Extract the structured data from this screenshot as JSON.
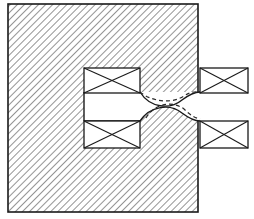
{
  "figure": {
    "title": "Hatched body cross-section with four crossed-rectangle coil symbols",
    "type": "engineering-cross-section",
    "canvas": {
      "width": 254,
      "height": 219
    },
    "colors": {
      "background": "#ffffff",
      "outline": "#1a1a1a",
      "hatch": "#3a3a3a",
      "dashed": "#2b2b2b"
    },
    "hatching": {
      "angle_degrees": 45,
      "direction": "top-left-to-bottom-right",
      "spacing_px": 5,
      "line_width_px": 1.1,
      "color": "#3a3a3a"
    },
    "body": {
      "label": "hatched-body",
      "x": 8,
      "y": 4,
      "width": 190,
      "height": 208,
      "stroke_width": 1.6
    },
    "notch": {
      "label": "rectangular-notch",
      "x": 84,
      "y": 92,
      "width": 114,
      "height": 28,
      "description": "white rectangular cut-out opening to the right edge of the body"
    },
    "coils": [
      {
        "name": "coil-upper-left",
        "position": "upper-left",
        "x": 84,
        "y": 68,
        "width": 56,
        "height": 25,
        "cross": true,
        "stroke_width": 1.3
      },
      {
        "name": "coil-upper-right",
        "position": "upper-right",
        "x": 200,
        "y": 68,
        "width": 48,
        "height": 25,
        "cross": true,
        "stroke_width": 1.3
      },
      {
        "name": "coil-lower-left",
        "position": "lower-left",
        "x": 84,
        "y": 121,
        "width": 56,
        "height": 27,
        "cross": true,
        "stroke_width": 1.3
      },
      {
        "name": "coil-lower-right",
        "position": "lower-right",
        "x": 200,
        "y": 121,
        "width": 48,
        "height": 27,
        "cross": true,
        "stroke_width": 1.3
      }
    ],
    "curves": [
      {
        "name": "upper-solid-curve",
        "style": "solid",
        "description": "concave dip from upper-left coil down and back up to upper-right coil",
        "path": "M 140 92 C 150 108, 170 110, 182 100 C 190 94, 195 92, 200 92"
      },
      {
        "name": "upper-dashed-curve",
        "style": "dashed",
        "dash_pattern": "4,3",
        "description": "dashed contour above the upper solid dip",
        "path": "M 140 92 C 152 102, 172 104, 184 96 C 191 91, 196 92, 200 92"
      },
      {
        "name": "lower-solid-curve",
        "style": "solid",
        "description": "convex hump rising from lower-left coil up and back down to lower-right coil",
        "path": "M 140 121 C 150 106, 170 103, 182 113 C 190 119, 195 121, 200 121"
      },
      {
        "name": "lower-dashed-curve",
        "style": "dashed",
        "dash_pattern": "4,3",
        "description": "dashed contour above the lower solid hump",
        "path": "M 146 118 C 154 104, 172 100, 184 109 C 191 116, 196 118, 200 119"
      }
    ]
  }
}
